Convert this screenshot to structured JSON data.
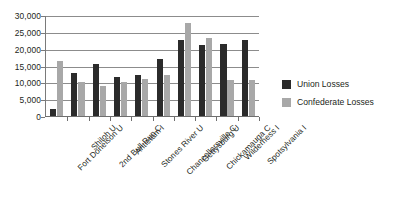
{
  "chart_data": {
    "type": "bar",
    "title": "",
    "xlabel": "",
    "ylabel": "",
    "ylim": [
      0,
      30000
    ],
    "ytick_labels": [
      "30,000",
      "25,000",
      "20,000",
      "15,000",
      "10,000",
      "5,000",
      "0"
    ],
    "ytick_values": [
      30000,
      25000,
      20000,
      15000,
      10000,
      5000,
      0
    ],
    "grid": true,
    "grid_axis": "y",
    "legend_position": "right",
    "categories": [
      "Fort Donelson U",
      "Shiloh U",
      "2nd Bull Run C",
      "Antietam I",
      "Stones River U",
      "Chancellorsville C",
      "Gettysburg U",
      "Chickamauga C",
      "Wilderness I",
      "Spotsylvania I"
    ],
    "series": [
      {
        "name": "Union Losses",
        "color": "#2b2b2b",
        "values": [
          2300,
          13000,
          15800,
          12000,
          12600,
          17200,
          22800,
          21500,
          21800,
          22900
        ]
      },
      {
        "name": "Confederate Losses",
        "color": "#a8a8a8",
        "values": [
          16700,
          10500,
          9100,
          10500,
          11400,
          12500,
          27800,
          23600,
          11000,
          11000
        ]
      }
    ]
  },
  "legend": {
    "entries": [
      {
        "label": "Union Losses",
        "swatch": "union"
      },
      {
        "label": "Confederate Losses",
        "swatch": "confederate"
      }
    ]
  }
}
